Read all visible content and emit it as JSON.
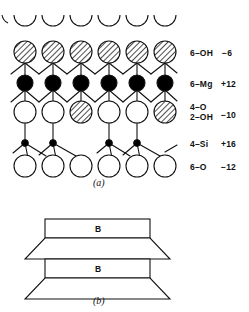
{
  "figure": {
    "panel_a": {
      "caption": "(a)",
      "rows": [
        {
          "id": "top-partial-oxygen-row",
          "style": "half-circle-arc",
          "count": 6,
          "fill": "white"
        },
        {
          "id": "hydroxyl-row",
          "style": "hatched-circle",
          "count": 6,
          "fills": [
            "hatched",
            "hatched",
            "hatched",
            "hatched",
            "hatched",
            "hatched"
          ]
        },
        {
          "id": "magnesium-row",
          "style": "solid-circle",
          "count": 6,
          "fills": [
            "black",
            "black",
            "black",
            "black",
            "black",
            "black"
          ]
        },
        {
          "id": "oxygen-hydroxyl-row",
          "style": "circle",
          "count": 6,
          "fills": [
            "white",
            "white",
            "hatched",
            "white",
            "white",
            "hatched"
          ]
        },
        {
          "id": "silicon-row",
          "style": "small-dot",
          "count": 4,
          "fills": [
            "black",
            "black",
            "black",
            "black"
          ]
        },
        {
          "id": "bottom-oxygen-row",
          "style": "circle",
          "count": 6,
          "fills": [
            "white",
            "white",
            "white",
            "white",
            "white",
            "white"
          ]
        }
      ],
      "labels": [
        {
          "species": "6–OH",
          "charge": "−6",
          "row": "hydroxyl-row"
        },
        {
          "species": "6–Mg",
          "charge": "+12",
          "row": "magnesium-row"
        },
        {
          "species": "4–O\n2–OH",
          "charge": "−10",
          "row": "oxygen-hydroxyl-row"
        },
        {
          "species": "4–Si",
          "charge": "+16",
          "row": "silicon-row"
        },
        {
          "species": "6–O",
          "charge": "−12",
          "row": "bottom-oxygen-row"
        }
      ]
    },
    "panel_b": {
      "caption": "(b)",
      "units": [
        {
          "letter": "B"
        },
        {
          "letter": "B"
        }
      ]
    },
    "colors": {
      "stroke": "#111111",
      "white_fill": "#ffffff",
      "black_fill": "#000000",
      "hatch_fill": "#b8b8b8",
      "background": "#ffffff"
    }
  }
}
